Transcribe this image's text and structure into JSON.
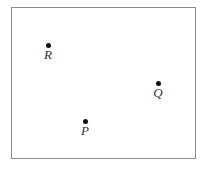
{
  "diagram": {
    "frame": {
      "x": 11,
      "y": 7,
      "width": 184,
      "height": 151,
      "border_color": "#8a8a8a"
    },
    "points": [
      {
        "id": "R",
        "label": "R",
        "x": 48,
        "y": 45
      },
      {
        "id": "Q",
        "label": "Q",
        "x": 158,
        "y": 83
      },
      {
        "id": "P",
        "label": "P",
        "x": 85,
        "y": 121
      }
    ],
    "dot_color": "#111111",
    "label_color": "#333333"
  }
}
